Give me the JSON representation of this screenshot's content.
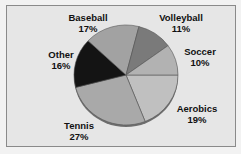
{
  "chart_data": {
    "type": "pie",
    "title": "",
    "categories": [
      "Aerobics",
      "Tennis",
      "Other",
      "Baseball",
      "Volleyball",
      "Soccer"
    ],
    "values": [
      19,
      27,
      16,
      17,
      11,
      10
    ],
    "unit": "%",
    "colors": [
      "#c0c0c0",
      "#a9a9a9",
      "#141414",
      "#a2a2a2",
      "#7a7a7a",
      "#b2b2b2"
    ],
    "start_angle_deg": 0,
    "direction": "clockwise",
    "legend": "none",
    "data_labels": "outside, category name and percent"
  },
  "labels": {
    "baseball": {
      "name": "Baseball",
      "pct": "17%"
    },
    "volleyball": {
      "name": "Volleyball",
      "pct": "11%"
    },
    "soccer": {
      "name": "Soccer",
      "pct": "10%"
    },
    "other": {
      "name": "Other",
      "pct": "16%"
    },
    "aerobics": {
      "name": "Aerobics",
      "pct": "19%"
    },
    "tennis": {
      "name": "Tennis",
      "pct": "27%"
    }
  }
}
